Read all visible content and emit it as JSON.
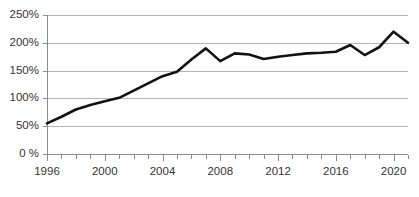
{
  "chart_data": {
    "type": "line",
    "title": "",
    "subtitle": "",
    "xlabel": "",
    "ylabel": "",
    "grid": true,
    "legend_position": "none",
    "xlim": [
      1996,
      2021
    ],
    "ylim": [
      0,
      250
    ],
    "y_tick_labels": [
      "250%",
      "200%",
      "150%",
      "100%",
      "50%",
      "0 %"
    ],
    "y_tick_values": [
      250,
      200,
      150,
      100,
      50,
      0
    ],
    "x_tick_labels": [
      "1996",
      "2000",
      "2004",
      "2008",
      "2012",
      "2016",
      "2020"
    ],
    "x_tick_values": [
      1996,
      2000,
      2004,
      2008,
      2012,
      2016,
      2020
    ],
    "x_minor_ticks": [
      1996,
      1997,
      1998,
      1999,
      2000,
      2001,
      2002,
      2003,
      2004,
      2005,
      2006,
      2007,
      2008,
      2009,
      2010,
      2011,
      2012,
      2013,
      2014,
      2015,
      2016,
      2017,
      2018,
      2019,
      2020,
      2021
    ],
    "series": [
      {
        "name": "value",
        "color": "#121212",
        "x": [
          1996,
          1997,
          1998,
          1999,
          2000,
          2001,
          2002,
          2003,
          2004,
          2005,
          2006,
          2007,
          2008,
          2009,
          2010,
          2011,
          2012,
          2013,
          2014,
          2015,
          2016,
          2017,
          2018,
          2019,
          2020,
          2021
        ],
        "values": [
          55,
          67,
          80,
          88,
          95,
          101,
          114,
          127,
          140,
          148,
          170,
          190,
          167,
          181,
          179,
          171,
          175,
          178,
          181,
          182,
          184,
          196,
          178,
          192,
          220,
          200
        ]
      }
    ]
  },
  "colors": {
    "line": "#121212",
    "grid": "#b4b4b4",
    "axis": "#8c8c8c",
    "text": "#333333",
    "background": "#ffffff"
  }
}
